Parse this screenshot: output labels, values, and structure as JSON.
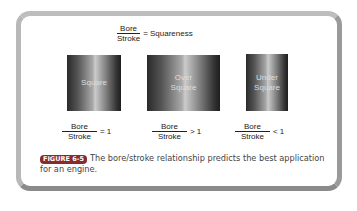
{
  "title_formula": {
    "numerator": "Bore",
    "denominator": "Stroke",
    "rhs": "= Squareness"
  },
  "cylinders": [
    {
      "label_line1": "Square",
      "label_line2": "",
      "formula": {
        "numerator": "Bore",
        "denominator": "Stroke",
        "rhs": "= 1"
      }
    },
    {
      "label_line1": "Over",
      "label_line2": "Square",
      "formula": {
        "numerator": "Bore",
        "denominator": "Stroke",
        "rhs": "> 1"
      }
    },
    {
      "label_line1": "Under",
      "label_line2": "Square",
      "formula": {
        "numerator": "Bore",
        "denominator": "Stroke",
        "rhs": "< 1"
      }
    }
  ],
  "caption": {
    "badge": "FIGURE 6-5",
    "text": "The bore/stroke relationship predicts the best application for an engine.",
    "badge_color": "#8a2a2a"
  }
}
